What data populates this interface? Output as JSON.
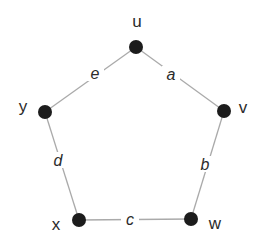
{
  "diagram": {
    "type": "undirected-cycle-graph",
    "canvas": {
      "width": 260,
      "height": 240,
      "background": "#ffffff"
    },
    "style": {
      "node_fill": "#1c1c1c",
      "node_radius": 7,
      "edge_stroke": "#aaaaaa",
      "edge_stroke_width": 1.3,
      "label_color": "#2b2b2b",
      "vertex_font_size": 17,
      "edge_font_size": 16,
      "edge_label_gap_width": 18,
      "edge_label_gap_height": 16
    },
    "nodes": [
      {
        "id": "u",
        "label": "u",
        "x": 136,
        "y": 47,
        "label_x": 137,
        "label_y": 21
      },
      {
        "id": "v",
        "label": "v",
        "x": 224,
        "y": 111,
        "label_x": 243,
        "label_y": 107
      },
      {
        "id": "w",
        "label": "w",
        "x": 191,
        "y": 219,
        "label_x": 215,
        "label_y": 223
      },
      {
        "id": "x",
        "label": "x",
        "x": 79,
        "y": 220,
        "label_x": 56,
        "label_y": 224
      },
      {
        "id": "y",
        "label": "y",
        "x": 45,
        "y": 112,
        "label_x": 23,
        "label_y": 106
      }
    ],
    "edges": [
      {
        "id": "a",
        "label": "a",
        "from": "u",
        "to": "v",
        "label_x": 171,
        "label_y": 74
      },
      {
        "id": "b",
        "label": "b",
        "from": "v",
        "to": "w",
        "label_x": 205,
        "label_y": 164
      },
      {
        "id": "c",
        "label": "c",
        "from": "x",
        "to": "w",
        "label_x": 130,
        "label_y": 219
      },
      {
        "id": "d",
        "label": "d",
        "from": "y",
        "to": "x",
        "label_x": 58,
        "label_y": 160
      },
      {
        "id": "e",
        "label": "e",
        "from": "u",
        "to": "y",
        "label_x": 95,
        "label_y": 73
      }
    ]
  }
}
